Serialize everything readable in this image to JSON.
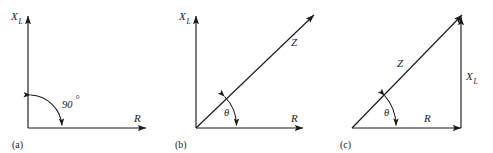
{
  "figure": {
    "background_color": "#ffffff",
    "line_color": "#1a1a1a",
    "panels": [
      {
        "caption": "(a)",
        "vertical_axis_label": "X",
        "vertical_axis_subscript": "L",
        "horizontal_axis_label": "R",
        "angle_label": "90",
        "angle_degree_symbol": "°",
        "description": "Right-angle axes with 90 degree arc between vertical reactance axis and horizontal resistance axis"
      },
      {
        "caption": "(b)",
        "vertical_axis_label": "X",
        "vertical_axis_subscript": "L",
        "horizontal_axis_label": "R",
        "vector_label": "Z",
        "angle_label": "θ",
        "description": "Impedance vector Z at angle theta from the R axis, drawn on X-L versus R axes"
      },
      {
        "caption": "(c)",
        "hypotenuse_label": "Z",
        "horizontal_label": "R",
        "vertical_label": "X",
        "vertical_subscript": "L",
        "angle_label": "θ",
        "description": "Impedance triangle with base R, vertical side X-L and hypotenuse Z at angle theta"
      }
    ]
  }
}
